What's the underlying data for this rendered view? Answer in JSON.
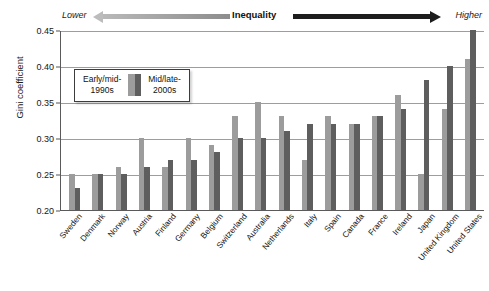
{
  "header": {
    "lower_label": "Lower",
    "center_label": "Inequality",
    "higher_label": "Higher",
    "arrow_left_color": "#b9b9b9",
    "arrow_right_color": "#1d1d1d"
  },
  "legend": {
    "early_label": "Early/mid-\n1990s",
    "late_label": "Mid/late-\n2000s",
    "early_color": "#9c9c9c",
    "late_color": "#5e5e5e"
  },
  "chart_data": {
    "type": "bar",
    "title": "",
    "xlabel": "",
    "ylabel": "Gini coefficient",
    "ylim": [
      0.2,
      0.45
    ],
    "yticks": [
      "0.45",
      "0.40",
      "0.35",
      "0.30",
      "0.25",
      "0.20"
    ],
    "ytick_values": [
      0.45,
      0.4,
      0.35,
      0.3,
      0.25,
      0.2
    ],
    "grid": true,
    "legend_position": "upper-left-inset",
    "categories": [
      "Sweden",
      "Denmark",
      "Norway",
      "Austria",
      "Finland",
      "Germany",
      "Belgium",
      "Switzerland",
      "Australia",
      "Netherlands",
      "Italy",
      "Spain",
      "Canada",
      "France",
      "Ireland",
      "Japan",
      "United Kingdom",
      "United States"
    ],
    "series": [
      {
        "name": "Early/mid-1990s",
        "color": "#9c9c9c",
        "values": [
          0.25,
          0.25,
          0.26,
          0.3,
          0.26,
          0.3,
          0.29,
          0.33,
          0.35,
          0.33,
          0.27,
          0.33,
          0.32,
          0.33,
          0.36,
          0.25,
          0.34,
          0.41
        ]
      },
      {
        "name": "Mid/late-2000s",
        "color": "#5e5e5e",
        "values": [
          0.23,
          0.25,
          0.25,
          0.26,
          0.27,
          0.27,
          0.28,
          0.3,
          0.3,
          0.31,
          0.32,
          0.32,
          0.32,
          0.33,
          0.34,
          0.38,
          0.4,
          0.45
        ]
      }
    ]
  }
}
